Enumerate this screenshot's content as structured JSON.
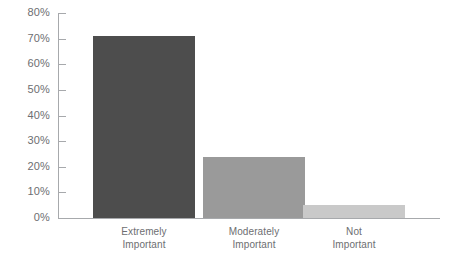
{
  "chart_data": {
    "type": "bar",
    "title": "",
    "subtitle": "",
    "xlabel": "",
    "ylabel": "",
    "categories": [
      "Extremely Important",
      "Moderately Important",
      "Not Important"
    ],
    "category_lines": [
      [
        "Extremely",
        "Important"
      ],
      [
        "Moderately",
        "Important"
      ],
      [
        "Not",
        "Important"
      ]
    ],
    "values": [
      71,
      24,
      5
    ],
    "value_labels": [
      "71%",
      "24%",
      "5%"
    ],
    "ylim": [
      0,
      80
    ],
    "y_ticks": [
      0,
      10,
      20,
      30,
      40,
      50,
      60,
      70,
      80
    ],
    "y_tick_labels": [
      "0%",
      "10%",
      "20%",
      "30%",
      "40%",
      "50%",
      "60%",
      "70%",
      "80%"
    ],
    "grid": false,
    "legend": "none",
    "bar_colors": [
      "#4d4d4d",
      "#9a9a9a",
      "#c9c9c9"
    ],
    "axis_color": "#a7a9ac",
    "text_color": "#6d6e71",
    "background": "#ffffff"
  }
}
